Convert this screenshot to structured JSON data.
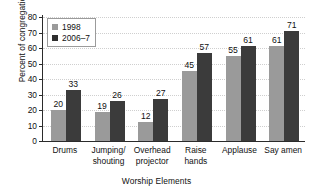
{
  "chart_data": {
    "type": "bar",
    "title": "",
    "xlabel": "Worship Elements",
    "ylabel": "Percent of congregations",
    "categories": [
      "Drums",
      "Jumping/\nshouting",
      "Overhead\nprojector",
      "Raise\nhands",
      "Applause",
      "Say amen"
    ],
    "series": [
      {
        "name": "1998",
        "color": "#9a9a9a",
        "values": [
          20,
          19,
          12,
          45,
          55,
          61
        ]
      },
      {
        "name": "2006–7",
        "color": "#3b3b3b",
        "values": [
          33,
          26,
          27,
          57,
          61,
          71
        ]
      }
    ],
    "ylim": [
      0,
      80
    ],
    "yticks": [
      0,
      10,
      20,
      30,
      40,
      50,
      60,
      70,
      80
    ],
    "ytick_labels": [
      "0",
      "10",
      "20",
      "30",
      "40",
      "50",
      "60",
      "70",
      "80"
    ],
    "grid": true,
    "grid_axis": "y",
    "legend_position": "upper-left",
    "data_labels": true
  },
  "legend": {
    "entries": [
      {
        "label": "1998",
        "swatch": "legend-swatch-1998"
      },
      {
        "label": "2006–7",
        "swatch": "legend-swatch-2006-7"
      }
    ]
  },
  "axis_titles": {
    "y": "Percent of congregations",
    "x": "Worship Elements"
  }
}
